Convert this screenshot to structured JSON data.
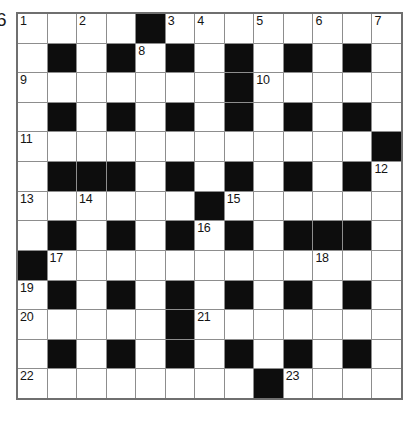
{
  "puzzle": {
    "kind": "crossword-grid",
    "edge_marker": "6",
    "rows": 13,
    "columns": 13,
    "colors": {
      "block": "#0d0d0d",
      "cell": "#ffffff",
      "rule": "#8d8d8d",
      "border": "#6f6f6f",
      "number": "#141414"
    },
    "grid": [
      [
        "w",
        "w",
        "w",
        "w",
        "b",
        "w",
        "w",
        "w",
        "w",
        "w",
        "w",
        "w",
        "w"
      ],
      [
        "w",
        "b",
        "w",
        "b",
        "w",
        "b",
        "w",
        "b",
        "w",
        "b",
        "w",
        "b",
        "w"
      ],
      [
        "w",
        "w",
        "w",
        "w",
        "w",
        "w",
        "w",
        "b",
        "w",
        "w",
        "w",
        "w",
        "w"
      ],
      [
        "w",
        "b",
        "w",
        "b",
        "w",
        "b",
        "w",
        "b",
        "w",
        "b",
        "w",
        "b",
        "w"
      ],
      [
        "w",
        "w",
        "w",
        "w",
        "w",
        "w",
        "w",
        "w",
        "w",
        "w",
        "w",
        "w",
        "b"
      ],
      [
        "w",
        "b",
        "b",
        "b",
        "w",
        "b",
        "w",
        "b",
        "w",
        "b",
        "w",
        "b",
        "w"
      ],
      [
        "w",
        "w",
        "w",
        "w",
        "w",
        "w",
        "b",
        "w",
        "w",
        "w",
        "w",
        "w",
        "w"
      ],
      [
        "w",
        "b",
        "w",
        "b",
        "w",
        "b",
        "w",
        "b",
        "w",
        "b",
        "b",
        "b",
        "w"
      ],
      [
        "b",
        "w",
        "w",
        "w",
        "w",
        "w",
        "w",
        "w",
        "w",
        "w",
        "w",
        "w",
        "w"
      ],
      [
        "w",
        "b",
        "w",
        "b",
        "w",
        "b",
        "w",
        "b",
        "w",
        "b",
        "w",
        "b",
        "w"
      ],
      [
        "w",
        "w",
        "w",
        "w",
        "w",
        "b",
        "w",
        "w",
        "w",
        "w",
        "w",
        "w",
        "w"
      ],
      [
        "w",
        "b",
        "w",
        "b",
        "w",
        "b",
        "w",
        "b",
        "w",
        "b",
        "w",
        "b",
        "w"
      ],
      [
        "w",
        "w",
        "w",
        "w",
        "w",
        "w",
        "w",
        "w",
        "b",
        "w",
        "w",
        "w",
        "w"
      ]
    ],
    "numbers": [
      {
        "n": "1",
        "row": 1,
        "col": 1
      },
      {
        "n": "2",
        "row": 1,
        "col": 3
      },
      {
        "n": "3",
        "row": 1,
        "col": 6
      },
      {
        "n": "4",
        "row": 1,
        "col": 7
      },
      {
        "n": "5",
        "row": 1,
        "col": 9
      },
      {
        "n": "6",
        "row": 1,
        "col": 11
      },
      {
        "n": "7",
        "row": 1,
        "col": 13
      },
      {
        "n": "8",
        "row": 2,
        "col": 5
      },
      {
        "n": "9",
        "row": 3,
        "col": 1
      },
      {
        "n": "10",
        "row": 3,
        "col": 9
      },
      {
        "n": "11",
        "row": 5,
        "col": 1
      },
      {
        "n": "12",
        "row": 6,
        "col": 13
      },
      {
        "n": "13",
        "row": 7,
        "col": 1
      },
      {
        "n": "14",
        "row": 7,
        "col": 3
      },
      {
        "n": "15",
        "row": 7,
        "col": 8
      },
      {
        "n": "16",
        "row": 8,
        "col": 7
      },
      {
        "n": "17",
        "row": 9,
        "col": 2
      },
      {
        "n": "18",
        "row": 9,
        "col": 11
      },
      {
        "n": "19",
        "row": 10,
        "col": 1
      },
      {
        "n": "20",
        "row": 11,
        "col": 1
      },
      {
        "n": "21",
        "row": 11,
        "col": 7
      },
      {
        "n": "22",
        "row": 13,
        "col": 1
      },
      {
        "n": "23",
        "row": 13,
        "col": 10
      }
    ]
  }
}
